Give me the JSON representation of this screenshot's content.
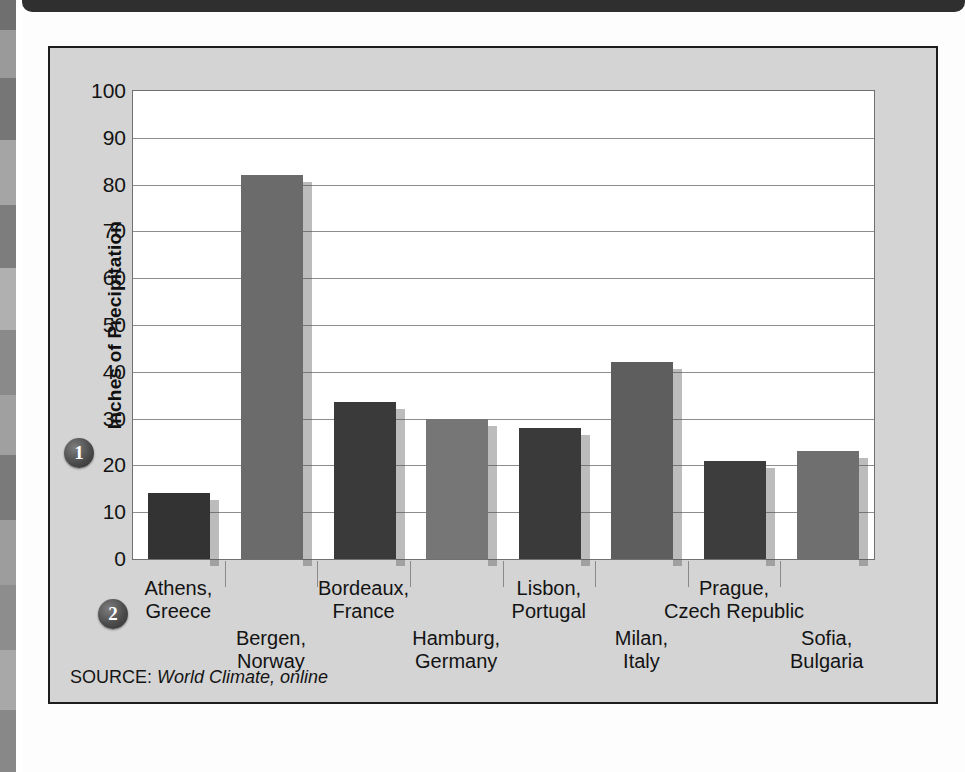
{
  "source": {
    "label": "SOURCE:",
    "value": "World Climate, online"
  },
  "markers": {
    "one": "1",
    "two": "2"
  },
  "chart_data": {
    "type": "bar",
    "title": "",
    "xlabel": "",
    "ylabel": "Inches of Precipitation",
    "ylim": [
      0,
      100
    ],
    "ytick_step": 10,
    "yticks": [
      "100",
      "90",
      "80",
      "70",
      "60",
      "50",
      "40",
      "30",
      "20",
      "10",
      "0"
    ],
    "grid": true,
    "legend": "none",
    "categories": [
      "Athens,\nGreece",
      "Bergen,\nNorway",
      "Bordeaux,\nFrance",
      "Hamburg,\nGermany",
      "Lisbon,\nPortugal",
      "Milan,\nItaly",
      "Prague,\nCzech Republic",
      "Sofia,\nBulgaria"
    ],
    "category_lines": [
      [
        "Athens,",
        "Greece"
      ],
      [
        "Bergen,",
        "Norway"
      ],
      [
        "Bordeaux,",
        "France"
      ],
      [
        "Hamburg,",
        "Germany"
      ],
      [
        "Lisbon,",
        "Portugal"
      ],
      [
        "Milan,",
        "Italy"
      ],
      [
        "Prague,",
        "Czech Republic"
      ],
      [
        "Sofia,",
        "Bulgaria"
      ]
    ],
    "label_rows": [
      "top",
      "bottom",
      "top",
      "bottom",
      "top",
      "bottom",
      "top",
      "bottom"
    ],
    "values": [
      14,
      82,
      33.5,
      30,
      28,
      42,
      21,
      23
    ],
    "bar_colors": [
      "#333333",
      "#6b6b6b",
      "#3a3a3a",
      "#767676",
      "#3a3a3a",
      "#5e5e5e",
      "#3d3d3d",
      "#6f6f6f"
    ]
  }
}
